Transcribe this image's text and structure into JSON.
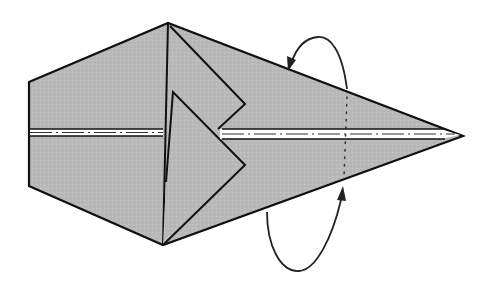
{
  "diagram": {
    "type": "origami-fold-step",
    "colors": {
      "paper": "#b9b9b9",
      "line": "#111111",
      "crease_white": "#ffffff",
      "arrow": "#222222",
      "background": "#ffffff"
    },
    "elements": [
      {
        "name": "paper-shape",
        "description": "Kite/arrow shaped folded paper pointing right"
      },
      {
        "name": "left-flap",
        "description": "Triangular flap folded at upper center"
      },
      {
        "name": "right-flap",
        "description": "Triangular flap folded at lower center"
      },
      {
        "name": "center-crease",
        "description": "Horizontal valley-fold line (white dash-dot)"
      },
      {
        "name": "mountain-fold-line",
        "description": "Vertical dotted fold line near tip"
      },
      {
        "name": "fold-arrow-top",
        "description": "Curved arrow folding tip behind (top)"
      },
      {
        "name": "fold-arrow-bottom",
        "description": "Curved arrow folding tip behind (bottom)"
      }
    ]
  }
}
